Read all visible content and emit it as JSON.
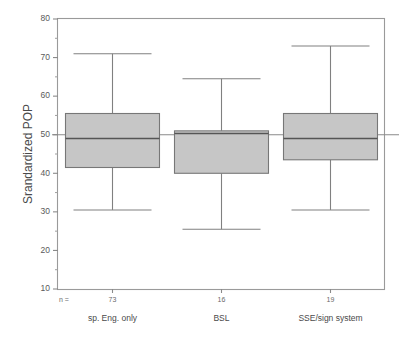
{
  "chart_data": {
    "type": "box",
    "title": "",
    "xlabel": "",
    "ylabel": "Srandardized POP",
    "ylim": [
      10,
      80
    ],
    "ytick_labels": [
      "80",
      "70",
      "60",
      "50",
      "40",
      "30",
      "20",
      "10"
    ],
    "ytick_values": [
      80,
      70,
      60,
      50,
      40,
      30,
      20,
      10
    ],
    "yminor_values": [
      75,
      65,
      55,
      45,
      35,
      25,
      15
    ],
    "grid": false,
    "legend": "none",
    "reference_line": {
      "value": 50,
      "label": "50",
      "orientation": "horizontal"
    },
    "n_row_label": "n =",
    "categories": [
      "sp. Eng. only",
      "BSL",
      "SSE/sign system"
    ],
    "counts": [
      73,
      16,
      19
    ],
    "count_labels": [
      "73",
      "16",
      "19"
    ],
    "boxes": [
      {
        "category": "sp. Eng. only",
        "n": 73,
        "whisker_low": 30.5,
        "q1": 41.5,
        "median": 49.0,
        "q3": 55.5,
        "whisker_high": 71.0
      },
      {
        "category": "BSL",
        "n": 16,
        "whisker_low": 25.5,
        "q1": 40.0,
        "median": 50.3,
        "q3": 51.0,
        "whisker_high": 64.5
      },
      {
        "category": "SSE/sign system",
        "n": 19,
        "whisker_low": 30.5,
        "q1": 43.5,
        "median": 49.0,
        "q3": 55.5,
        "whisker_high": 73.0
      }
    ],
    "colors": {
      "box_fill": "#c6c6c6",
      "box_edge": "#777777",
      "median": "#555555",
      "whisker": "#808080",
      "axis": "#8a8a8a",
      "text": "#4a4a4a",
      "background": "#ffffff"
    }
  }
}
